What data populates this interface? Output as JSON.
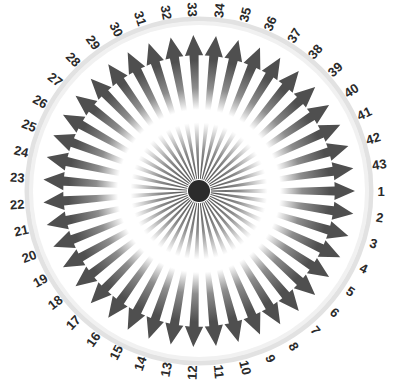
{
  "figure": {
    "kind": "radial-rosette-diagram",
    "title": "",
    "background_color": "#ffffff"
  },
  "chart_data": {
    "type": "pie",
    "title": "",
    "xlabel": "",
    "ylabel": "",
    "legend_position": "none",
    "grid": false,
    "segment_count": 43,
    "categories": [
      "1",
      "2",
      "3",
      "4",
      "5",
      "6",
      "7",
      "8",
      "9",
      "10",
      "11",
      "12",
      "13",
      "14",
      "15",
      "16",
      "17",
      "18",
      "19",
      "20",
      "21",
      "22",
      "23",
      "24",
      "25",
      "26",
      "27",
      "28",
      "29",
      "30",
      "31",
      "32",
      "33",
      "34",
      "35",
      "36",
      "37",
      "38",
      "39",
      "40",
      "41",
      "42",
      "43"
    ],
    "values": [
      1,
      1,
      1,
      1,
      1,
      1,
      1,
      1,
      1,
      1,
      1,
      1,
      1,
      1,
      1,
      1,
      1,
      1,
      1,
      1,
      1,
      1,
      1,
      1,
      1,
      1,
      1,
      1,
      1,
      1,
      1,
      1,
      1,
      1,
      1,
      1,
      1,
      1,
      1,
      1,
      1,
      1,
      1
    ],
    "direction": "clockwise",
    "start_label": "1",
    "start_angle_deg": 0,
    "label_ring_radius_px": 182,
    "annotations": []
  },
  "geometry": {
    "center_x": 199,
    "center_y": 191,
    "outer_ring_radius": 172,
    "spoke_tip_radius": 156,
    "spoke_base_radius": 12,
    "hub_radius": 11
  },
  "colors": {
    "spoke_dark": "#4f4f4f",
    "spoke_mid": "#8d8d8d",
    "spoke_highlight": "#ffffff",
    "hub": "#2b2b2b",
    "ring": "#e2e2e2",
    "label_text": "#2a2a2a",
    "background": "#ffffff"
  },
  "labels": [
    {
      "text": "1"
    },
    {
      "text": "2"
    },
    {
      "text": "3"
    },
    {
      "text": "4"
    },
    {
      "text": "5"
    },
    {
      "text": "6"
    },
    {
      "text": "7"
    },
    {
      "text": "8"
    },
    {
      "text": "9"
    },
    {
      "text": "10"
    },
    {
      "text": "11"
    },
    {
      "text": "12"
    },
    {
      "text": "13"
    },
    {
      "text": "14"
    },
    {
      "text": "15"
    },
    {
      "text": "16"
    },
    {
      "text": "17"
    },
    {
      "text": "18"
    },
    {
      "text": "19"
    },
    {
      "text": "20"
    },
    {
      "text": "21"
    },
    {
      "text": "22"
    },
    {
      "text": "23"
    },
    {
      "text": "24"
    },
    {
      "text": "25"
    },
    {
      "text": "26"
    },
    {
      "text": "27"
    },
    {
      "text": "28"
    },
    {
      "text": "29"
    },
    {
      "text": "30"
    },
    {
      "text": "31"
    },
    {
      "text": "32"
    },
    {
      "text": "33"
    },
    {
      "text": "34"
    },
    {
      "text": "35"
    },
    {
      "text": "36"
    },
    {
      "text": "37"
    },
    {
      "text": "38"
    },
    {
      "text": "39"
    },
    {
      "text": "40"
    },
    {
      "text": "41"
    },
    {
      "text": "42"
    },
    {
      "text": "43"
    }
  ]
}
